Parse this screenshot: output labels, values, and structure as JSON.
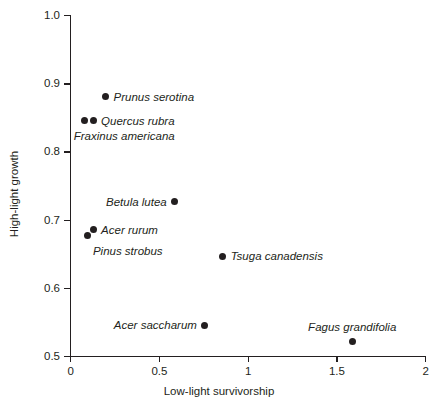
{
  "chart_data": {
    "type": "scatter",
    "title": "",
    "xlabel": "Low-light survivorship",
    "ylabel": "High-light growth",
    "xlim": [
      0,
      2
    ],
    "ylim": [
      0.5,
      1.0
    ],
    "xticks": [
      "0",
      "0.5",
      "1",
      "1.5",
      "2"
    ],
    "xtick_values": [
      0,
      0.5,
      1,
      1.5,
      2
    ],
    "yticks": [
      "0.5",
      "0.6",
      "0.7",
      "0.8",
      "0.9",
      "1.0"
    ],
    "ytick_values": [
      0.5,
      0.6,
      0.7,
      0.8,
      0.9,
      1.0
    ],
    "grid": false,
    "legend": "none",
    "points": [
      {
        "label": "Prunus serotina",
        "x": 0.2,
        "y": 0.88,
        "label_side": "right"
      },
      {
        "label": "Quercus rubra",
        "x": 0.13,
        "y": 0.845,
        "label_side": "right"
      },
      {
        "label": "Fraxinus americana",
        "x": 0.08,
        "y": 0.845,
        "label_side": "below"
      },
      {
        "label": "Betula lutea",
        "x": 0.59,
        "y": 0.726,
        "label_side": "left"
      },
      {
        "label": "Acer rurum",
        "x": 0.13,
        "y": 0.685,
        "label_side": "right"
      },
      {
        "label": "Pinus strobus",
        "x": 0.1,
        "y": 0.676,
        "label_side": "below"
      },
      {
        "label": "Tsuga canadensis",
        "x": 0.86,
        "y": 0.646,
        "label_side": "right"
      },
      {
        "label": "Acer saccharum",
        "x": 0.76,
        "y": 0.545,
        "label_side": "left"
      },
      {
        "label": "Fagus grandifolia",
        "x": 1.59,
        "y": 0.521,
        "label_side": "above"
      }
    ]
  },
  "colors": {
    "marker": "#231f20",
    "axis": "#231f20",
    "background": "#ffffff"
  },
  "caption_sliver": ""
}
